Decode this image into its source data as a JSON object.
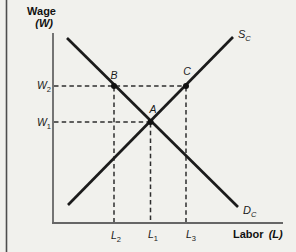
{
  "figure": {
    "type": "labor-market-supply-demand-diagram",
    "y_axis": {
      "title": "Wage",
      "symbol": "(W)",
      "ticks": [
        {
          "base": "W",
          "sub": "2"
        },
        {
          "base": "W",
          "sub": "1"
        }
      ]
    },
    "x_axis": {
      "title": "Labor",
      "symbol": "(L)",
      "ticks": [
        {
          "base": "L",
          "sub": "2"
        },
        {
          "base": "L",
          "sub": "1"
        },
        {
          "base": "L",
          "sub": "3"
        }
      ]
    },
    "curves": [
      {
        "name": "supply",
        "base": "S",
        "sub": "C"
      },
      {
        "name": "demand",
        "base": "D",
        "sub": "C"
      }
    ],
    "points": [
      {
        "label": "A"
      },
      {
        "label": "B"
      },
      {
        "label": "C"
      }
    ],
    "colors": {
      "background": "#f1f1ed",
      "curve": "#1b1b1b",
      "axis": "#666666",
      "dashed_guide": "#2e2e2e",
      "page_edge": "#4d4d4d"
    }
  }
}
